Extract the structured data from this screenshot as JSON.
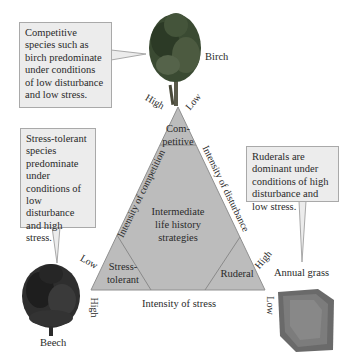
{
  "callouts": {
    "competitive": "Competitive species such as birch predominate under conditions of low disturbance and low stress.",
    "stress_tolerant": "Stress-tolerant species predominate under conditions of low disturbance and high stress.",
    "ruderal": "Ruderals are dominant under conditions of high disturbance and low stress."
  },
  "species": {
    "birch": "Birch",
    "beech": "Beech",
    "annual_grass": "Annual grass"
  },
  "triangle": {
    "regions": {
      "competitive_line1": "Com-",
      "competitive_line2": "petitive",
      "intermediate_line1": "Intermediate",
      "intermediate_line2": "life history",
      "intermediate_line3": "strategies",
      "stress_tolerant_line1": "Stress-",
      "stress_tolerant_line2": "tolerant",
      "ruderal": "Ruderal"
    },
    "axes": {
      "competition": "Intensity of competition",
      "disturbance": "Intensity of disturbance",
      "stress": "Intensity of stress"
    },
    "ticks": {
      "competition_high": "High",
      "competition_low": "Low",
      "disturbance_low": "Low",
      "disturbance_high": "High",
      "stress_high": "High",
      "stress_low": "Low"
    }
  },
  "colors": {
    "triangle_fill": "#b8b8b8",
    "triangle_stroke": "#8e8e8e",
    "callout_fill": "#ececec"
  }
}
